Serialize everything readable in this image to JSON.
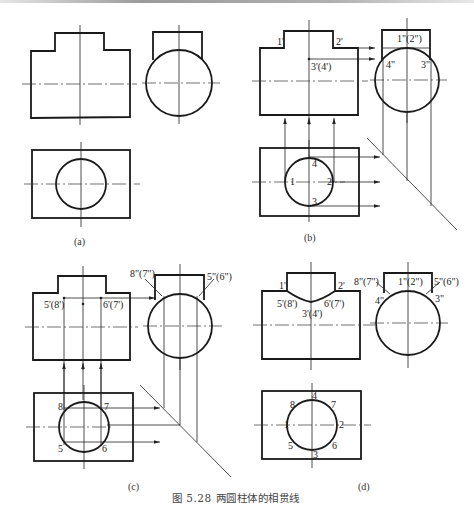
{
  "figure": {
    "caption": "图 5.28   两圆柱体的相贯线",
    "number": "5.28",
    "title": "两圆柱体的相贯线"
  },
  "panels": [
    {
      "id": "a",
      "label": "(a)",
      "points": []
    },
    {
      "id": "b",
      "label": "(b)",
      "front_view_labels": [
        "1'",
        "2'",
        "3'(4')"
      ],
      "side_view_labels": [
        "1\"(2\")",
        "4\"",
        "3\""
      ],
      "top_view_labels": [
        "1",
        "2",
        "3",
        "4"
      ]
    },
    {
      "id": "c",
      "label": "(c)",
      "front_view_labels": [
        "5'(8')",
        "6'(7')"
      ],
      "side_view_labels": [
        "8\"(7\")",
        "5\"(6\")"
      ],
      "top_view_labels": [
        "5",
        "6",
        "7",
        "8"
      ]
    },
    {
      "id": "d",
      "label": "(d)",
      "front_view_labels": [
        "1'",
        "2'",
        "5'(8')",
        "6'(7')",
        "3'(4')"
      ],
      "side_view_labels": [
        "8\"(7\")",
        "1\"(2\")",
        "5\"(6\")",
        "4\"",
        "3\""
      ],
      "top_view_labels": [
        "1",
        "2",
        "3",
        "4",
        "5",
        "6",
        "7",
        "8"
      ]
    }
  ],
  "labels": {
    "a": "(a)",
    "b": "(b)",
    "c": "(c)",
    "d": "(d)",
    "b_1p": "1'",
    "b_2p": "2'",
    "b_34p": "3'(4')",
    "b_12pp": "1\"(2\")",
    "b_4pp": "4\"",
    "b_3pp": "3\"",
    "b_1": "1",
    "b_2": "2",
    "b_3": "3",
    "b_4": "4",
    "c_58p": "5'(8')",
    "c_67p": "6'(7')",
    "c_87pp": "8\"(7\")",
    "c_56pp": "5\"(6\")",
    "c_5": "5",
    "c_6": "6",
    "c_7": "7",
    "c_8": "8",
    "d_1p": "1'",
    "d_2p": "2'",
    "d_58p": "5'(8')",
    "d_67p": "6'(7')",
    "d_34p": "3'(4')",
    "d_87pp": "8\"(7\")",
    "d_12pp": "1\"(2\")",
    "d_56pp": "5\"(6\")",
    "d_4pp": "4\"",
    "d_3pp": "3\"",
    "d_1": "1",
    "d_2": "2",
    "d_3": "3",
    "d_4": "4",
    "d_5": "5",
    "d_6": "6",
    "d_7": "7",
    "d_8": "8"
  },
  "colors": {
    "line": "#1a1a1a",
    "background": "#ffffff"
  }
}
